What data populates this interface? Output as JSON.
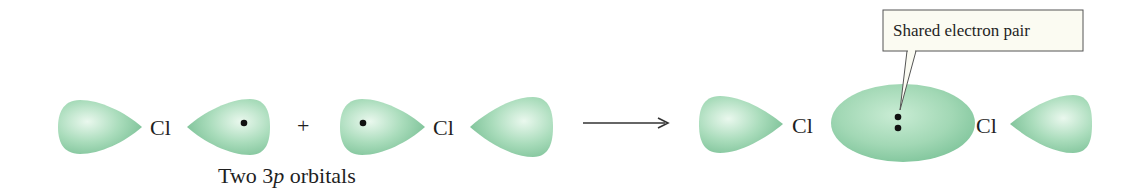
{
  "diagram": {
    "left_atom_1": {
      "symbol": "Cl"
    },
    "left_atom_2": {
      "symbol": "Cl"
    },
    "plus_sign": "+",
    "caption_prefix": "Two 3",
    "caption_italic": "p",
    "caption_suffix": " orbitals",
    "product_atom_1": {
      "symbol": "Cl"
    },
    "product_atom_2": {
      "symbol": "Cl"
    },
    "callout_label": "Shared electron pair",
    "colors": {
      "orbital_fill": "#9fd6b2",
      "orbital_highlight": "#e6f6ea",
      "orbital_shadow": "#6fb98c",
      "callout_bg": "#fbfbf2",
      "callout_border": "#555555",
      "electron": "#111111"
    }
  }
}
